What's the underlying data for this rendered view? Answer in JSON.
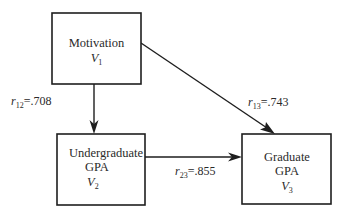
{
  "diagram": {
    "type": "path-diagram",
    "nodes": [
      {
        "id": "V1",
        "lines": [
          "Motivation"
        ],
        "var_letter": "V",
        "var_sub": "1"
      },
      {
        "id": "V2",
        "lines": [
          "Undergraduate",
          "GPA"
        ],
        "var_letter": "V",
        "var_sub": "2"
      },
      {
        "id": "V3",
        "lines": [
          "Graduate",
          "GPA"
        ],
        "var_letter": "V",
        "var_sub": "3"
      }
    ],
    "edges": [
      {
        "from": "V1",
        "to": "V2",
        "r_letter": "r",
        "r_sub": "12",
        "value_text": "=.708",
        "value": 0.708
      },
      {
        "from": "V1",
        "to": "V3",
        "r_letter": "r",
        "r_sub": "13",
        "value_text": "=.743",
        "value": 0.743
      },
      {
        "from": "V2",
        "to": "V3",
        "r_letter": "r",
        "r_sub": "23",
        "value_text": "=.855",
        "value": 0.855
      }
    ]
  }
}
